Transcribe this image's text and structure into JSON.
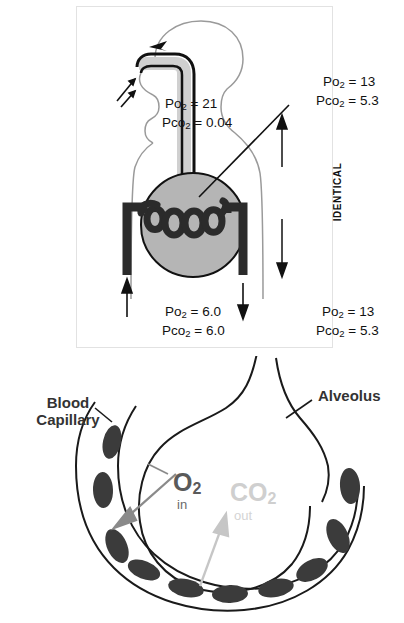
{
  "figure": {
    "top_panel": {
      "name": "gas-exchange-schematic",
      "labels": {
        "inspired_air": {
          "po2": "Po2 = 21",
          "pco2": "Pco2 = 0.04"
        },
        "alveolar_gas": {
          "po2": "Po2 = 13",
          "pco2": "Pco2 = 5.3"
        },
        "mixed_venous_blood": {
          "po2": "Po2 = 6.0",
          "pco2": "Pco2 = 6.0"
        },
        "arterial_blood": {
          "po2": "Po2 = 13",
          "pco2": "Pco2 = 5.3"
        },
        "comparison": "IDENTICAL"
      },
      "values": {
        "inspired_po2": 21,
        "inspired_pco2": 0.04,
        "alveolar_po2": 13,
        "alveolar_pco2": 5.3,
        "venous_po2": 6.0,
        "venous_pco2": 6.0,
        "arterial_po2": 13,
        "arterial_pco2": 5.3
      },
      "colors": {
        "panel_border": "#e2e2e2",
        "alveolus_fill": "#b5b5b5",
        "vessel_dark": "#2b2b2b",
        "airway_fill": "#d0d0d0",
        "body_outline": "#9a9a9a",
        "text": "#111111"
      }
    },
    "bottom_panel": {
      "name": "alveolar-capillary-diffusion",
      "labels": {
        "blood_capillary_line1": "Blood",
        "blood_capillary_line2": "Capillary",
        "alveolus": "Alveolus",
        "o2": "O2",
        "o2_direction": "in",
        "co2": "CO2",
        "co2_direction": "out"
      },
      "colors": {
        "outline": "#1a1a1a",
        "cell_fill": "#3b3b3b",
        "o2_text": "#5a5a5a",
        "co2_text": "#cfcfcf",
        "label_text": "#333333"
      }
    }
  }
}
